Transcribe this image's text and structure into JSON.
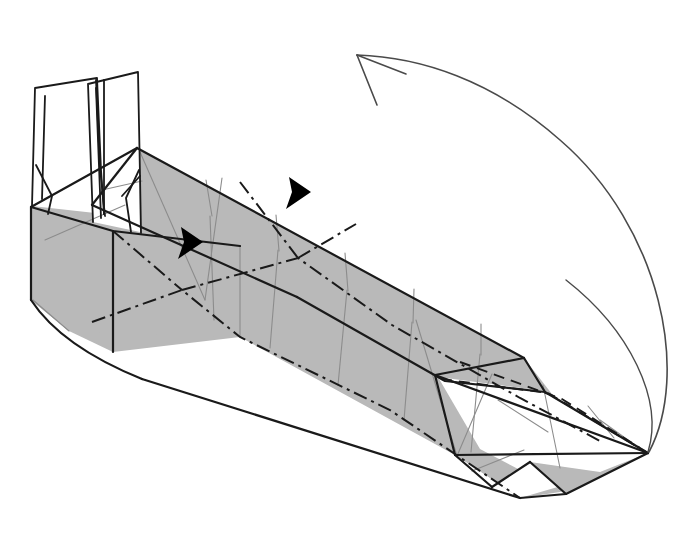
{
  "document": {
    "kind": "origami-folding-diagram",
    "title": "Origami step diagram — long box form with two upright white flaps",
    "background_color": "#ffffff",
    "canvas": {
      "width": 689,
      "height": 547
    }
  },
  "palette": {
    "paper_front_gray": "#b9b9b9",
    "paper_back_white": "#ffffff",
    "outline_black": "#1a1a1a",
    "crease_thin_gray": "#8c8c8c",
    "fold_dashdot": "#1a1a1a",
    "fold_dashed": "#1a1a1a",
    "arrow_stroke": "#4a4a4a",
    "arrowhead_fill": "#000000"
  },
  "line_styles": {
    "edge": {
      "name": "silhouette-edge",
      "width": 2.2,
      "dash": "none"
    },
    "crease_valley": {
      "name": "valley-crease-dash-dot",
      "width": 2.0,
      "dash": "14 5 3 5"
    },
    "crease_hidden": {
      "name": "hidden-edge-dashed",
      "width": 1.9,
      "dash": "11 7"
    },
    "crease_light": {
      "name": "light-crease",
      "width": 1.1,
      "dash": "none"
    },
    "arrow": {
      "name": "fold-arrow",
      "width": 1.6,
      "dash": "none"
    }
  },
  "shapes": {
    "top_face": {
      "name": "top-slanted-face",
      "fill": "#b9b9b9",
      "points": "137,148 524,358 545,392 445,381 297,297 92,205"
    },
    "front_face": {
      "name": "front-long-face",
      "fill": "#b9b9b9",
      "points": "31,207 137,148 524,358 555,398 570,449 601,472 560,492 520,498 455,455 240,337 69,331 31,300"
    },
    "left_end_face": {
      "name": "left-end-panel",
      "fill": "#b9b9b9",
      "points": "31,207 113,231 113,352 69,331 31,300"
    },
    "left_bottom_face": {
      "name": "left-lower-panel",
      "fill": "#b9b9b9",
      "points": "113,231 240,246 240,337 113,352"
    },
    "right_white_inner": {
      "name": "right-inner-white-pocket",
      "fill": "#ffffff",
      "points": "435,375 545,392 648,453 565,495 476,451"
    },
    "right_gray_flap": {
      "name": "right-lower-gray-flap",
      "fill": "#b9b9b9",
      "points": "520,498 560,492 648,453 602,474"
    },
    "flap_left": {
      "name": "white-flap-left",
      "fill": "#ffffff",
      "points": "32,206 35,88 97,78 104,214"
    },
    "flap_right": {
      "name": "white-flap-right",
      "fill": "#ffffff",
      "points": "93,222 88,84 138,72 140,232"
    }
  },
  "annotations": {
    "main_fold_arrow": {
      "name": "large-curved-fold-arrow",
      "description": "long curved arrow sweeping from the lower-right tip up and left to the arrowhead",
      "path": "M 648,452 C 686,380 660,230 560,140 C 490,78 420,56 357,55",
      "head_tip": {
        "x": 357,
        "y": 55
      },
      "head_wing_a": {
        "x": 404,
        "y": 74
      },
      "head_wing_b": {
        "x": 376,
        "y": 104
      },
      "style": "open-v-arrowhead"
    },
    "solid_arrowheads": [
      {
        "name": "black-arrowhead-upper",
        "points": "291,180 309,192 288,208 292,191",
        "rotation_hint": "points up-right"
      },
      {
        "name": "black-arrowhead-lower",
        "points": "183,230 201,243 180,258 185,241",
        "rotation_hint": "points up-right"
      }
    ]
  },
  "creases": {
    "dash_dot_folds": [
      {
        "name": "valley-fold-front-long",
        "d": "M 92,322 L 240,337 L 389,409 L 520,498"
      },
      {
        "name": "valley-fold-upper-long",
        "d": "M 240,246 L 390,323 L 520,398 L 600,441"
      },
      {
        "name": "valley-fold-left-zigzag",
        "d": "M 113,231 L 182,290 L 240,246"
      },
      {
        "name": "valley-fold-left-lower-v",
        "d": "M 113,352 L 182,290"
      },
      {
        "name": "valley-fold-mid-zigzag",
        "d": "M 239,182 L 298,258 L 355,223"
      },
      {
        "name": "valley-fold-mid-drop",
        "d": "M 240,337 L 298,258"
      }
    ],
    "dashed_hidden": [
      {
        "name": "hidden-edge-right-pocket",
        "d": "M 440,378 L 545,392 L 648,453"
      },
      {
        "name": "hidden-edge-right-upper",
        "d": "M 455,360 L 560,398 L 640,448"
      }
    ],
    "thin_creases": [
      {
        "name": "thin-crease-v1",
        "d": "M 113,231 L 113,352"
      },
      {
        "name": "thin-crease-v2",
        "d": "M 240,246 L 240,337"
      },
      {
        "name": "thin-crease-v3",
        "d": "M 208,214 L 213,318"
      },
      {
        "name": "thin-crease-v4",
        "d": "M 276,248 L 268,346"
      },
      {
        "name": "thin-crease-v5",
        "d": "M 345,288 L 336,383"
      },
      {
        "name": "thin-crease-v6",
        "d": "M 410,320 L 402,418"
      },
      {
        "name": "thin-crease-v7",
        "d": "M 478,352 L 470,452"
      },
      {
        "name": "thin-crease-v8",
        "d": "M 137,148 L 205,218"
      },
      {
        "name": "thin-crease-diag-a",
        "d": "M 137,155 L 200,300"
      },
      {
        "name": "thin-crease-diag-b",
        "d": "M 200,300 L 218,176"
      },
      {
        "name": "thin-crease-zig-c",
        "d": "M 418,322 L 455,455"
      },
      {
        "name": "thin-crease-zig-d",
        "d": "M 455,455 L 490,372"
      },
      {
        "name": "thin-crease-right-1",
        "d": "M 495,400 L 545,430"
      },
      {
        "name": "thin-crease-right-2",
        "d": "M 540,382 L 560,470"
      },
      {
        "name": "thin-crease-right-3",
        "d": "M 586,404 L 612,436"
      },
      {
        "name": "thin-crease-right-4",
        "d": "M 470,470 L 520,450"
      },
      {
        "name": "thin-crease-flap-a",
        "d": "M 45,240 L 123,205"
      },
      {
        "name": "thin-crease-flap-b",
        "d": "M 100,188 L 140,180"
      }
    ]
  },
  "labels": {
    "caption": "",
    "step_number": ""
  }
}
